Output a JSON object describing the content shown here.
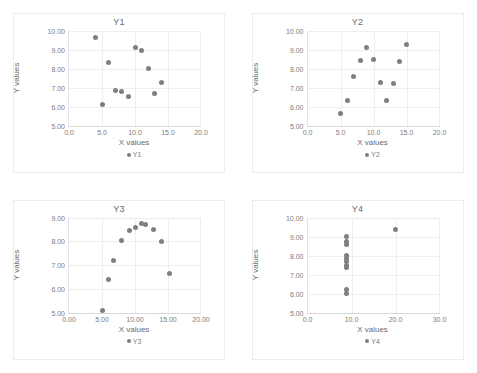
{
  "page": {
    "background": "#ffffff",
    "marker_color": "#7f7f7f",
    "gridline_color": "#eeeeee",
    "text_color": "#7d7d7d"
  },
  "charts": [
    {
      "title": "Y1",
      "xlabel": "X values",
      "ylabel": "Y values",
      "legend": "Y1",
      "xticks": [
        "0.0",
        "5.0",
        "10.0",
        "15.0",
        "20.0"
      ],
      "xtick_values": [
        0,
        5,
        10,
        15,
        20
      ],
      "yticks": [
        "5.00",
        "6.00",
        "7.00",
        "8.00",
        "9.00",
        "10.00"
      ],
      "ytick_values": [
        5,
        6,
        7,
        8,
        9,
        10
      ],
      "xlim": [
        0,
        20
      ],
      "ylim": [
        5,
        10
      ]
    },
    {
      "title": "Y2",
      "xlabel": "X values",
      "ylabel": "Y values",
      "legend": "Y2",
      "xticks": [
        "0.0",
        "5.0",
        "10.0",
        "15.0",
        "20.0"
      ],
      "xtick_values": [
        0,
        5,
        10,
        15,
        20
      ],
      "yticks": [
        "5.00",
        "6.00",
        "7.00",
        "8.00",
        "9.00",
        "10.00"
      ],
      "ytick_values": [
        5,
        6,
        7,
        8,
        9,
        10
      ],
      "xlim": [
        0,
        20
      ],
      "ylim": [
        5,
        10
      ]
    },
    {
      "title": "Y3",
      "xlabel": "X values",
      "ylabel": "Y values",
      "legend": "Y3",
      "xticks": [
        "0.00",
        "5.00",
        "10.00",
        "15.00",
        "20.00"
      ],
      "xtick_values": [
        0,
        5,
        10,
        15,
        20
      ],
      "yticks": [
        "5.00",
        "6.00",
        "7.00",
        "8.00",
        "9.00"
      ],
      "ytick_values": [
        5,
        6,
        7,
        8,
        9
      ],
      "xlim": [
        0,
        20
      ],
      "ylim": [
        5,
        9
      ]
    },
    {
      "title": "Y4",
      "xlabel": "X values",
      "ylabel": "Y values",
      "legend": "Y4",
      "xticks": [
        "0.0",
        "10.0",
        "20.0",
        "30.0"
      ],
      "xtick_values": [
        0,
        10,
        20,
        30
      ],
      "yticks": [
        "5.00",
        "6.00",
        "7.00",
        "8.00",
        "9.00",
        "10.00"
      ],
      "ytick_values": [
        5,
        6,
        7,
        8,
        9,
        10
      ],
      "xlim": [
        0,
        30
      ],
      "ylim": [
        5,
        10
      ]
    }
  ],
  "chart_data": [
    {
      "type": "scatter",
      "title": "Y1",
      "xlabel": "X values",
      "ylabel": "Y values",
      "legend": [
        "Y1"
      ],
      "legend_position": "bottom",
      "grid": true,
      "xlim": [
        0,
        20
      ],
      "ylim": [
        5,
        10
      ],
      "x": [
        10.0,
        8.0,
        13.0,
        9.0,
        11.0,
        14.0,
        6.0,
        4.0,
        12.0,
        7.0,
        5.0
      ],
      "y": [
        9.14,
        6.81,
        6.71,
        6.57,
        8.95,
        7.31,
        8.35,
        9.66,
        8.03,
        6.85,
        6.11
      ],
      "note": "point at x=4 plots near x=15 in rendering of this sheet; values read off axes"
    },
    {
      "type": "scatter",
      "title": "Y2",
      "xlabel": "X values",
      "ylabel": "Y values",
      "legend": [
        "Y2"
      ],
      "legend_position": "bottom",
      "grid": true,
      "xlim": [
        0,
        20
      ],
      "ylim": [
        5,
        10
      ],
      "x": [
        5.0,
        6.0,
        7.0,
        8.0,
        9.0,
        10.0,
        11.0,
        12.0,
        13.0,
        14.0,
        15.0
      ],
      "y": [
        5.68,
        6.34,
        7.6,
        8.47,
        9.11,
        8.51,
        7.31,
        6.34,
        7.26,
        8.38,
        9.28
      ]
    },
    {
      "type": "scatter",
      "title": "Y3",
      "xlabel": "X values",
      "ylabel": "Y values",
      "legend": [
        "Y3"
      ],
      "legend_position": "bottom",
      "grid": true,
      "xlim": [
        0,
        20
      ],
      "ylim": [
        5,
        9
      ],
      "x": [
        5.0,
        6.0,
        6.8,
        8.0,
        9.2,
        10.0,
        11.0,
        11.6,
        12.8,
        14.0,
        15.2
      ],
      "y": [
        5.07,
        6.37,
        7.19,
        8.02,
        8.46,
        8.6,
        8.73,
        8.72,
        8.49,
        7.99,
        6.66
      ]
    },
    {
      "type": "scatter",
      "title": "Y4",
      "xlabel": "X values",
      "ylabel": "Y values",
      "legend": [
        "Y4"
      ],
      "legend_position": "bottom",
      "grid": true,
      "xlim": [
        0,
        30
      ],
      "ylim": [
        5,
        10
      ],
      "x": [
        8.9,
        8.9,
        8.9,
        8.9,
        8.9,
        8.9,
        8.9,
        8.9,
        8.9,
        8.9,
        20.0
      ],
      "y": [
        8.99,
        8.73,
        8.6,
        7.99,
        7.86,
        7.71,
        7.5,
        7.35,
        6.21,
        6.01,
        9.38
      ]
    }
  ]
}
